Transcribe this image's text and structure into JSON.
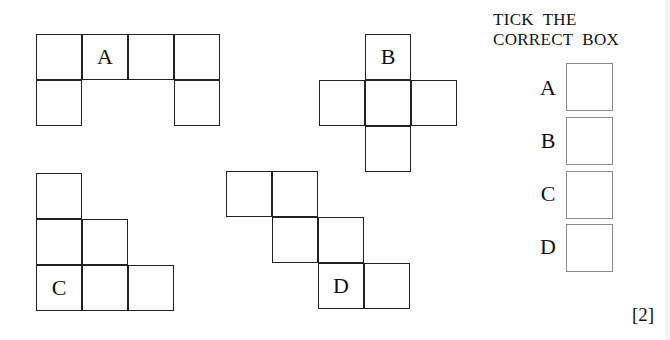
{
  "instruction": {
    "line1": "TICK  THE",
    "line2": "CORRECT  BOX"
  },
  "nets": [
    {
      "label": "A",
      "cells": [
        [
          36,
          34
        ],
        [
          82,
          34
        ],
        [
          128,
          34
        ],
        [
          174,
          34
        ],
        [
          36,
          80
        ],
        [
          174,
          80
        ]
      ],
      "label_cell": 1
    },
    {
      "label": "B",
      "cells": [
        [
          365,
          34
        ],
        [
          319,
          80
        ],
        [
          365,
          80
        ],
        [
          411,
          80
        ],
        [
          365,
          126
        ]
      ],
      "label_cell": 0
    },
    {
      "label": "C",
      "cells": [
        [
          36,
          173
        ],
        [
          36,
          219
        ],
        [
          82,
          219
        ],
        [
          36,
          265
        ],
        [
          82,
          265
        ],
        [
          128,
          265
        ]
      ],
      "label_cell": 3
    },
    {
      "label": "D",
      "cells": [
        [
          226,
          171
        ],
        [
          272,
          171
        ],
        [
          272,
          217
        ],
        [
          318,
          217
        ],
        [
          318,
          263
        ],
        [
          364,
          263
        ]
      ],
      "label_cell": 4
    }
  ],
  "options": [
    {
      "label": "A",
      "checked": false
    },
    {
      "label": "B",
      "checked": false
    },
    {
      "label": "C",
      "checked": false
    },
    {
      "label": "D",
      "checked": false
    }
  ],
  "marks": "[2]"
}
